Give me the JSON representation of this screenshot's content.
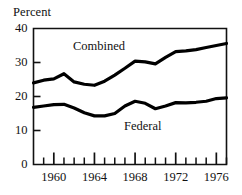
{
  "chart_data": {
    "type": "line",
    "title": "",
    "subtitle": "",
    "xlabel": "",
    "ylabel": "Percent",
    "ylim": [
      0,
      40
    ],
    "xlim": [
      1958,
      1977
    ],
    "grid": false,
    "legend_position": "inline-annotations",
    "y_ticks": [
      0,
      10,
      20,
      30,
      40
    ],
    "y_tick_labels": [
      "0",
      "10",
      "20",
      "30",
      "40"
    ],
    "x_major_ticks": [
      1960,
      1964,
      1968,
      1972,
      1976
    ],
    "x_major_tick_labels": [
      "1960",
      "1964",
      "1968",
      "1972",
      "1976"
    ],
    "x_minor_ticks": [
      1959,
      1961,
      1962,
      1963,
      1965,
      1966,
      1967,
      1969,
      1970,
      1971,
      1973,
      1974,
      1975,
      1977
    ],
    "x": [
      1958,
      1959,
      1960,
      1961,
      1962,
      1963,
      1964,
      1965,
      1966,
      1967,
      1968,
      1969,
      1970,
      1971,
      1972,
      1973,
      1974,
      1975,
      1976,
      1977
    ],
    "series": [
      {
        "name": "Combined",
        "label": "Combined",
        "color": "#000000",
        "values": [
          24.0,
          24.8,
          25.2,
          26.7,
          24.3,
          23.6,
          23.3,
          24.5,
          26.3,
          28.3,
          30.4,
          30.2,
          29.6,
          31.5,
          33.2,
          33.4,
          33.8,
          34.4,
          35.0,
          35.6
        ]
      },
      {
        "name": "Federal",
        "label": "Federal",
        "color": "#000000",
        "values": [
          16.8,
          17.2,
          17.6,
          17.7,
          16.6,
          15.2,
          14.3,
          14.3,
          15.0,
          17.2,
          18.6,
          18.0,
          16.4,
          17.2,
          18.2,
          18.1,
          18.3,
          18.6,
          19.4,
          19.6
        ]
      }
    ],
    "annotations": [
      {
        "text": "Combined",
        "x": 1962.5,
        "y": 33.5
      },
      {
        "text": "Federal",
        "x": 1968.0,
        "y": 11.5
      }
    ]
  },
  "axis": {
    "y_title": "Percent"
  }
}
